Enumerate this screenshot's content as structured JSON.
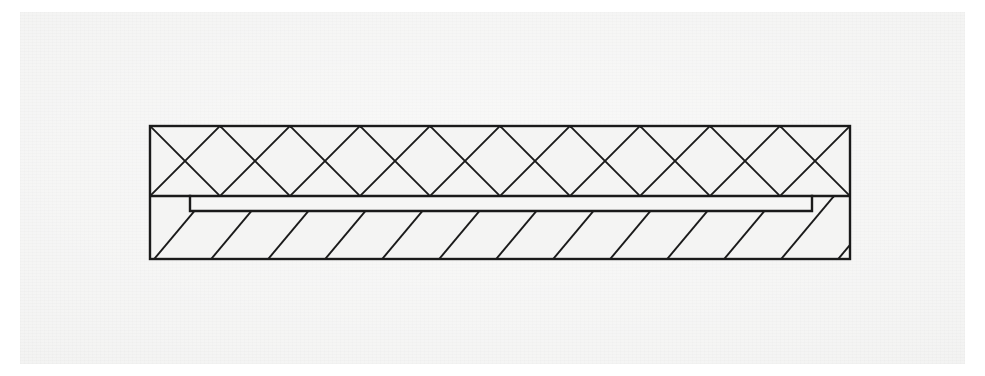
{
  "figure": {
    "kind": "engineering-cross-section",
    "caption": "",
    "label": "",
    "width": 985,
    "height": 376
  },
  "canvas": {
    "background_color": "#ffffff",
    "paper_color": "#f2f2f1",
    "paper_x": 20,
    "paper_y": 12,
    "paper_width": 945,
    "paper_height": 352
  },
  "style": {
    "line_color": "#1a1a1a",
    "outline_width": 2.4,
    "hatch_width": 1.9,
    "fill_color": "#f4f4f3",
    "insert_fill_color": "#f6f6f5"
  },
  "geometry": {
    "outer": {
      "x": 150,
      "y": 126,
      "width": 700,
      "height": 133,
      "right": 850,
      "bottom": 259
    },
    "divider_y": 196,
    "upper_band": {
      "x": 150,
      "y": 126,
      "width": 700,
      "height": 70,
      "hatch": "cross-diamond"
    },
    "lower_band": {
      "x": 150,
      "y": 196,
      "width": 700,
      "height": 63,
      "hatch": "diagonal-right"
    },
    "insert": {
      "x": 190,
      "y": 196,
      "width": 622,
      "height": 15,
      "right": 812,
      "bottom": 211,
      "hatch": "none"
    }
  },
  "hatching": {
    "upper": {
      "pattern": "cross-hatch",
      "period_px": 70,
      "angle_deg": 45,
      "counter_angle_deg": -45,
      "diamond_count": 21
    },
    "lower": {
      "pattern": "single-diagonal",
      "period_px": 57,
      "angle_deg": -40,
      "direction": "lower-left-to-upper-right",
      "line_count": 13
    }
  },
  "annotations": []
}
